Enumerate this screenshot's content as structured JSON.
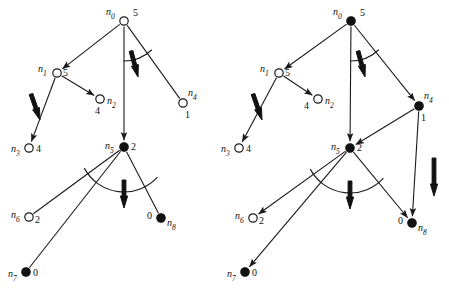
{
  "figure": {
    "type": "diagram",
    "background_color": "#ffffff",
    "ink_color": "#111111"
  },
  "panels": [
    {
      "id": "left-graph",
      "name": "left-tree",
      "nodes": [
        {
          "id": "n0",
          "label": "n",
          "sub": "0",
          "value": "5",
          "fill": "open",
          "cx": 124,
          "cy": 21,
          "r": 4.2,
          "label_dx": -18,
          "label_dy": -6,
          "value_dx": 9,
          "value_dy": -5
        },
        {
          "id": "n1",
          "label": "n",
          "sub": "1",
          "value": "5",
          "fill": "open",
          "cx": 57,
          "cy": 73,
          "r": 4.2,
          "label_dx": -19,
          "label_dy": -1,
          "value_dx": 6,
          "value_dy": 3
        },
        {
          "id": "n2",
          "label": "n",
          "sub": "2",
          "value": "4",
          "fill": "open",
          "cx": 100,
          "cy": 99,
          "r": 4.2,
          "label_dx": 7,
          "label_dy": 5,
          "value_dx": -5,
          "value_dy": 15
        },
        {
          "id": "n3",
          "label": "n",
          "sub": "3",
          "value": "4",
          "fill": "open",
          "cx": 29,
          "cy": 148,
          "r": 4.2,
          "label_dx": -18,
          "label_dy": 4,
          "value_dx": 7,
          "value_dy": 4
        },
        {
          "id": "n4",
          "label": "n",
          "sub": "4",
          "value": "1",
          "fill": "open",
          "cx": 183,
          "cy": 103,
          "r": 4.2,
          "label_dx": 5,
          "label_dy": -7,
          "value_dx": 2,
          "value_dy": 15
        },
        {
          "id": "n5",
          "label": "n",
          "sub": "5",
          "value": "2",
          "fill": "filled",
          "cx": 124,
          "cy": 147,
          "r": 4.2,
          "label_dx": -19,
          "label_dy": 2,
          "value_dx": 7,
          "value_dy": 3
        },
        {
          "id": "n6",
          "label": "n",
          "sub": "6",
          "value": "2",
          "fill": "open",
          "cx": 29,
          "cy": 217,
          "r": 4.2,
          "label_dx": -18,
          "label_dy": 1,
          "value_dx": 6,
          "value_dy": 6
        },
        {
          "id": "n7",
          "label": "n",
          "sub": "7",
          "value": "0",
          "fill": "filled",
          "cx": 26,
          "cy": 272,
          "r": 4.2,
          "label_dx": -18,
          "label_dy": 5,
          "value_dx": 7,
          "value_dy": 4
        },
        {
          "id": "n8",
          "label": "n",
          "sub": "8",
          "value": "0",
          "fill": "filled",
          "cx": 161,
          "cy": 218,
          "r": 4.2,
          "label_dx": 6,
          "label_dy": 8,
          "value_dx": -14,
          "value_dy": 1
        }
      ],
      "edges": [
        {
          "from": "n0",
          "to": "n1",
          "arrow": true
        },
        {
          "from": "n0",
          "to": "n5",
          "arrow": true
        },
        {
          "from": "n0",
          "to": "n4",
          "arrow": false
        },
        {
          "from": "n1",
          "to": "n2",
          "arrow": true
        },
        {
          "from": "n1",
          "to": "n3",
          "arrow": true
        },
        {
          "from": "n5",
          "to": "n6",
          "arrow": false
        },
        {
          "from": "n5",
          "to": "n7",
          "arrow": false
        },
        {
          "from": "n5",
          "to": "n8",
          "arrow": false
        }
      ],
      "arcs": [
        {
          "name": "arc-n0",
          "cx": 124,
          "cy": 21,
          "r": 40,
          "a1": 91,
          "a2": 46
        },
        {
          "name": "arc-n5",
          "cx": 124,
          "cy": 147,
          "r": 45,
          "a1": 152,
          "a2": 42
        }
      ],
      "bold_arrows": [
        {
          "name": "bold-arrow-n0-n5",
          "x1": 131,
          "y1": 51,
          "x2": 138,
          "y2": 77
        },
        {
          "name": "bold-arrow-n1-n3",
          "x1": 31,
          "y1": 94,
          "x2": 40,
          "y2": 120
        },
        {
          "name": "bold-arrow-n5-down",
          "x1": 124,
          "y1": 180,
          "x2": 124,
          "y2": 208
        }
      ]
    },
    {
      "id": "right-graph",
      "name": "right-tree",
      "nodes": [
        {
          "id": "n0",
          "label": "n",
          "sub": "0",
          "value": "5",
          "fill": "filled",
          "cx": 351,
          "cy": 21,
          "r": 4.2,
          "label_dx": -18,
          "label_dy": -6,
          "value_dx": 9,
          "value_dy": -5
        },
        {
          "id": "n1",
          "label": "n",
          "sub": "1",
          "value": "5",
          "fill": "open",
          "cx": 279,
          "cy": 73,
          "r": 4.2,
          "label_dx": -19,
          "label_dy": -1,
          "value_dx": 6,
          "value_dy": 3
        },
        {
          "id": "n2",
          "label": "n",
          "sub": "2",
          "value": "4",
          "fill": "open",
          "cx": 318,
          "cy": 99,
          "r": 4.2,
          "label_dx": 7,
          "label_dy": 5,
          "value_dx": -14,
          "value_dy": 10
        },
        {
          "id": "n3",
          "label": "n",
          "sub": "3",
          "value": "4",
          "fill": "open",
          "cx": 239,
          "cy": 148,
          "r": 4.2,
          "label_dx": -18,
          "label_dy": 4,
          "value_dx": 7,
          "value_dy": 4
        },
        {
          "id": "n4",
          "label": "n",
          "sub": "4",
          "value": "1",
          "fill": "filled",
          "cx": 419,
          "cy": 106,
          "r": 4.2,
          "label_dx": 5,
          "label_dy": -7,
          "value_dx": 2,
          "value_dy": 15
        },
        {
          "id": "n5",
          "label": "n",
          "sub": "5",
          "value": "2",
          "fill": "filled",
          "cx": 350,
          "cy": 148,
          "r": 4.2,
          "label_dx": -19,
          "label_dy": 2,
          "value_dx": 7,
          "value_dy": 3
        },
        {
          "id": "n6",
          "label": "n",
          "sub": "6",
          "value": "2",
          "fill": "open",
          "cx": 253,
          "cy": 218,
          "r": 4.2,
          "label_dx": -18,
          "label_dy": 1,
          "value_dx": 6,
          "value_dy": 6
        },
        {
          "id": "n7",
          "label": "n",
          "sub": "7",
          "value": "0",
          "fill": "filled",
          "cx": 245,
          "cy": 272,
          "r": 4.2,
          "label_dx": -18,
          "label_dy": 5,
          "value_dx": 7,
          "value_dy": 4
        },
        {
          "id": "n8",
          "label": "n",
          "sub": "8",
          "value": "0",
          "fill": "filled",
          "cx": 412,
          "cy": 223,
          "r": 4.2,
          "label_dx": 6,
          "label_dy": 8,
          "value_dx": -14,
          "value_dy": 1
        }
      ],
      "edges": [
        {
          "from": "n0",
          "to": "n1",
          "arrow": true
        },
        {
          "from": "n0",
          "to": "n5",
          "arrow": true
        },
        {
          "from": "n0",
          "to": "n4",
          "arrow": true
        },
        {
          "from": "n1",
          "to": "n2",
          "arrow": true
        },
        {
          "from": "n1",
          "to": "n3",
          "arrow": true
        },
        {
          "from": "n4",
          "to": "n5",
          "arrow": true
        },
        {
          "from": "n4",
          "to": "n8",
          "arrow": true
        },
        {
          "from": "n5",
          "to": "n6",
          "arrow": true
        },
        {
          "from": "n5",
          "to": "n7",
          "arrow": true
        },
        {
          "from": "n5",
          "to": "n8",
          "arrow": true
        }
      ],
      "arcs": [
        {
          "name": "arc-n0",
          "cx": 351,
          "cy": 21,
          "r": 40,
          "a1": 91,
          "a2": 46
        },
        {
          "name": "arc-n5",
          "cx": 350,
          "cy": 148,
          "r": 45,
          "a1": 152,
          "a2": 42
        }
      ],
      "bold_arrows": [
        {
          "name": "bold-arrow-n0-n5",
          "x1": 358,
          "y1": 51,
          "x2": 365,
          "y2": 77
        },
        {
          "name": "bold-arrow-n1-n3",
          "x1": 253,
          "y1": 94,
          "x2": 262,
          "y2": 120
        },
        {
          "name": "bold-arrow-n5-down",
          "x1": 350,
          "y1": 181,
          "x2": 350,
          "y2": 209
        },
        {
          "name": "bold-arrow-n4-n8",
          "x1": 434,
          "y1": 158,
          "x2": 434,
          "y2": 196
        }
      ]
    }
  ]
}
